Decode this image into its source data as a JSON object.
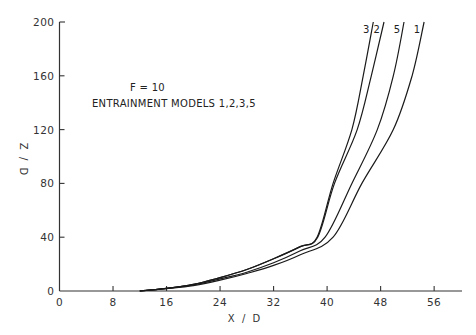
{
  "chart_data": {
    "type": "line",
    "title": "",
    "annotations": [
      "F = 10",
      "ENTRAINMENT MODELS 1,2,3,5"
    ],
    "xlabel": "X / D",
    "ylabel": "Z / D",
    "xlim": [
      0,
      60
    ],
    "ylim": [
      0,
      200
    ],
    "xticks": [
      0,
      8,
      16,
      24,
      32,
      40,
      48,
      56
    ],
    "yticks": [
      0,
      40,
      80,
      120,
      160,
      200
    ],
    "grid": false,
    "legend": "curve labels at top of each line",
    "series": [
      {
        "name": "3",
        "x": [
          12,
          16,
          20,
          24,
          28,
          32,
          36,
          38.5,
          40.9,
          43.7,
          45.4,
          46.9
        ],
        "y": [
          0,
          2,
          5,
          10,
          16,
          24,
          33,
          40,
          80,
          120,
          160,
          200
        ]
      },
      {
        "name": "2",
        "x": [
          12,
          16,
          20,
          24,
          28,
          32,
          36,
          38.6,
          41.1,
          44.5,
          46.6,
          48.5
        ],
        "y": [
          0,
          2,
          5,
          10,
          16,
          24,
          33,
          40,
          80,
          120,
          160,
          200
        ]
      },
      {
        "name": "5",
        "x": [
          12,
          16,
          20,
          24,
          28,
          32,
          36,
          39.7,
          43.7,
          47.5,
          49.9,
          51.5
        ],
        "y": [
          0,
          2,
          4.5,
          9,
          14,
          21,
          30,
          40,
          80,
          120,
          160,
          200
        ]
      },
      {
        "name": "1",
        "x": [
          12,
          16,
          20,
          24,
          28,
          32,
          36,
          40.9,
          45.2,
          49.9,
          52.7,
          54.5
        ],
        "y": [
          0,
          1.8,
          4,
          8,
          13,
          19,
          27,
          40,
          80,
          120,
          160,
          200
        ]
      }
    ]
  },
  "labels": {
    "annotation_line1": "F = 10",
    "annotation_line2": "ENTRAINMENT MODELS 1,2,3,5",
    "xlabel": "X / D",
    "ylabel": "Z / D",
    "xticks": [
      "0",
      "8",
      "16",
      "24",
      "32",
      "40",
      "48",
      "56"
    ],
    "yticks": [
      "0",
      "40",
      "80",
      "120",
      "160",
      "200"
    ],
    "curve_labels": [
      "3",
      "2",
      "5",
      "1"
    ]
  }
}
